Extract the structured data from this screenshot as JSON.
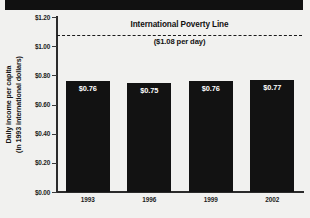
{
  "chart_data": {
    "type": "bar",
    "title": "",
    "xlabel": "",
    "ylabel": "Daily income per capita",
    "ylabel_line2": "(in 1993 international dollars)",
    "categories": [
      "1993",
      "1996",
      "1999",
      "2002"
    ],
    "values": [
      0.76,
      0.75,
      0.76,
      0.77
    ],
    "value_labels": [
      "$0.76",
      "$0.75",
      "$0.76",
      "$0.77"
    ],
    "ylim": [
      0.0,
      1.2
    ],
    "y_ticks": [
      1.2,
      1.0,
      0.8,
      0.6,
      0.4,
      0.2,
      0.0
    ],
    "y_tick_labels": [
      "$1.20",
      "$1.00",
      "$0.80",
      "$0.60",
      "$0.40",
      "$0.20",
      "$0.00"
    ],
    "grid": false,
    "legend": "none",
    "annotations": [
      {
        "name": "international-poverty-line",
        "label": "International Poverty Line",
        "sublabel": "($1.08 per day)",
        "value": 1.08,
        "style": "dashed-horizontal-line"
      }
    ],
    "colors": {
      "bar": "#121212",
      "background": "#f1f1ef",
      "axis": "#2b2b2b",
      "text": "#1c1c1c",
      "bar_value_text": "#ffffff",
      "poverty_line": "#1a1a1a",
      "masthead": "#111111"
    }
  },
  "masthead": {
    "label": ""
  }
}
